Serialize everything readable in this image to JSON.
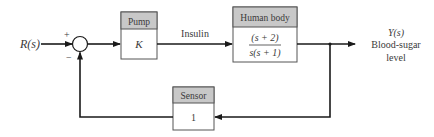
{
  "diagram": {
    "type": "feedback-control-block-diagram",
    "input": {
      "label": "R(s)"
    },
    "summing_junction": {
      "plus_sign": "+",
      "minus_sign": "−"
    },
    "blocks": [
      {
        "id": "pump",
        "title": "Pump",
        "content": "K"
      },
      {
        "id": "human_body",
        "title": "Human body",
        "numerator": "(s + 2)",
        "denominator": "s(s + 1)"
      },
      {
        "id": "sensor",
        "title": "Sensor",
        "content": "1"
      }
    ],
    "signals": {
      "insulin": "Insulin"
    },
    "output": {
      "label": "Y(s)",
      "line1": "Blood-sugar",
      "line2": "level"
    }
  },
  "colors": {
    "line": "#1a1a1a",
    "header_fill": "#c8c8c8",
    "box_stroke": "#555555",
    "text": "#3a3a3a"
  }
}
